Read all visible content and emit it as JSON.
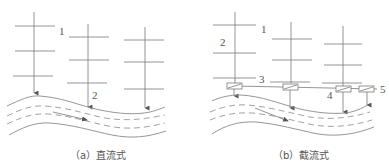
{
  "diagram": {
    "panels": [
      {
        "id": "a",
        "caption": "（a）直流式",
        "labels": {
          "l1": "1",
          "l2": "2"
        }
      },
      {
        "id": "b",
        "caption": "（b）截流式",
        "labels": {
          "l1": "1",
          "l2": "2",
          "l3": "3",
          "l4": "4",
          "l5": "5"
        }
      }
    ],
    "colors": {
      "line": "#7a7a7a",
      "text": "#555555",
      "background": "#ffffff"
    }
  }
}
